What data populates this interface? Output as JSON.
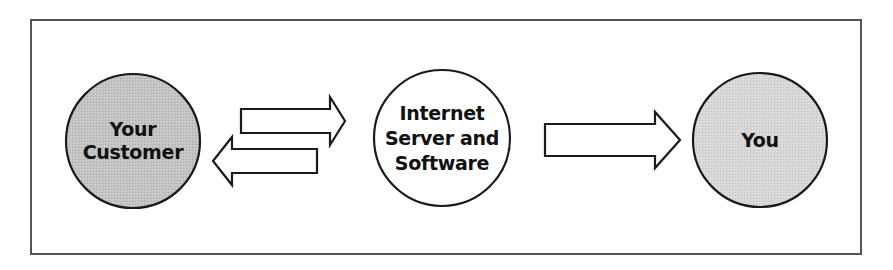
{
  "diagram": {
    "type": "flow",
    "nodes": [
      {
        "id": "customer",
        "label_lines": [
          "Your",
          "Customer"
        ],
        "fill": "#c4c4c4"
      },
      {
        "id": "server",
        "label_lines": [
          "Internet",
          "Server and",
          "Software"
        ],
        "fill": "#ffffff"
      },
      {
        "id": "you",
        "label_lines": [
          "You"
        ],
        "fill": "#d8d8d8"
      }
    ],
    "edges": [
      {
        "from": "customer",
        "to": "server",
        "direction": "right"
      },
      {
        "from": "server",
        "to": "customer",
        "direction": "left"
      },
      {
        "from": "server",
        "to": "you",
        "direction": "right"
      }
    ],
    "colors": {
      "stroke": "#1a1a1a",
      "frame": "#555555",
      "customer_fill": "#c4c4c4",
      "you_fill": "#d8d8d8",
      "server_fill": "#ffffff"
    }
  }
}
